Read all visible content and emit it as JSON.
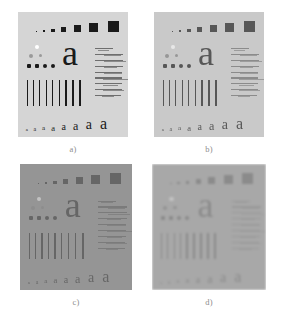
{
  "figure": {
    "type": "image-comparison-grid",
    "background_color": "#ffffff",
    "columns": 2,
    "rows": 2
  },
  "panels": [
    {
      "id": "a",
      "caption": "a)",
      "position": "top-left",
      "background_color": "#d5d5d5",
      "ink_color": "#1a1a1a",
      "quality": "sharp high contrast",
      "blur_px": 0,
      "contrast": 1.0
    },
    {
      "id": "b",
      "caption": "b)",
      "position": "top-right",
      "background_color": "#d9d9d9",
      "ink_color": "#4a4a4a",
      "quality": "slightly noisy reduced contrast",
      "blur_px": 0,
      "contrast": 0.78
    },
    {
      "id": "c",
      "caption": "c)",
      "position": "bottom-left",
      "background_color": "#a9a9a9",
      "ink_color": "#4f4f4f",
      "quality": "low contrast flat gray",
      "blur_px": 0,
      "contrast": 0.52
    },
    {
      "id": "d",
      "caption": "d)",
      "position": "bottom-right",
      "background_color": "#c6c6c6",
      "ink_color": "#8a8a8a",
      "quality": "heavily blurred low contrast",
      "blur_px": 1.15,
      "contrast": 0.46
    }
  ],
  "chart_content": {
    "square_row": {
      "label": "graduated filled squares",
      "count": 7,
      "sizes_px": [
        1.5,
        2.5,
        3.5,
        5,
        7,
        9,
        11
      ]
    },
    "dot_rows": [
      {
        "label": "highlight dot row",
        "count": 1,
        "tone": "white",
        "sizes_px": [
          4.5
        ]
      },
      {
        "label": "mid gray dot row",
        "count": 2,
        "tone": "gray",
        "sizes_px": [
          4,
          3.5
        ]
      },
      {
        "label": "dark dot row",
        "count": 4,
        "tone": "dark",
        "sizes_px": [
          4,
          4,
          4,
          4
        ]
      }
    ],
    "large_letter": {
      "label": "large lowercase a",
      "character": "a",
      "size_px": 36
    },
    "texture_block": {
      "label": "fine print texture patch",
      "lines": 9
    },
    "bar_group": {
      "label": "vertical line pairs of increasing width",
      "count": 9,
      "widths_px": [
        1,
        1,
        1.2,
        1.2,
        1.5,
        1.5,
        1.8,
        1.8,
        2
      ]
    },
    "letter_row": {
      "label": "graduated lowercase a row",
      "character": "a",
      "count": 8,
      "sizes_px": [
        5,
        6,
        7,
        8.5,
        10,
        12,
        14,
        16
      ]
    }
  }
}
